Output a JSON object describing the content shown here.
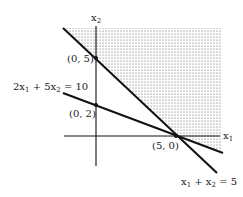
{
  "diagram": {
    "type": "linear-programming-feasible-region",
    "axes": {
      "x_label": "x",
      "x_sub": "1",
      "y_label": "x",
      "y_sub": "2"
    },
    "lines": [
      {
        "name": "x1+x2=5",
        "label_parts": [
          "x",
          "1",
          " + x",
          "2",
          " = 5"
        ],
        "intercepts": [
          [
            0,
            5
          ],
          [
            5,
            0
          ]
        ]
      },
      {
        "name": "2x1+5x2=10",
        "label_parts": [
          "2x",
          "1",
          " + 5x",
          "2",
          " = 10"
        ],
        "intercepts": [
          [
            0,
            2
          ],
          [
            5,
            0
          ]
        ]
      }
    ],
    "points": [
      {
        "label": "(0, 5)"
      },
      {
        "label": "(0, 2)"
      },
      {
        "label": "(5, 0)"
      }
    ],
    "shaded_region": "x1 + x2 >= 5 and 2x1 + 5x2 >= 10",
    "colors": {
      "ink": "#111111",
      "shade_dot": "#555555",
      "background": "#ffffff"
    }
  }
}
